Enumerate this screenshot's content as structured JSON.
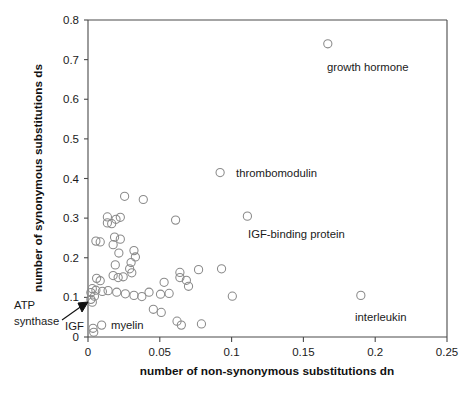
{
  "chart_data": {
    "type": "scatter",
    "title": "",
    "xlabel": "number of non-synonymous substitutions dn",
    "ylabel": "number of synonymous substitutions ds",
    "xlim": [
      0,
      0.25
    ],
    "ylim": [
      0,
      0.8
    ],
    "xticks": [
      "0",
      "0.05",
      "0.1",
      "0.15",
      "0.2",
      "0.25"
    ],
    "xtick_values": [
      0,
      0.05,
      0.1,
      0.15,
      0.2,
      0.25
    ],
    "yticks": [
      "0",
      "0.1",
      "0.2",
      "0.3",
      "0.4",
      "0.5",
      "0.6",
      "0.7",
      "0.8"
    ],
    "ytick_values": [
      0,
      0.1,
      0.2,
      0.3,
      0.4,
      0.5,
      0.6,
      0.7,
      0.8
    ],
    "grid": false,
    "legend": "none",
    "marker": "open-circle",
    "marker_color": "#8a8a8a",
    "points": [
      {
        "x": 0.167,
        "y": 0.74,
        "label": "growth hormone"
      },
      {
        "x": 0.092,
        "y": 0.415,
        "label": "thrombomodulin"
      },
      {
        "x": 0.111,
        "y": 0.305,
        "label": "IGF-binding protein"
      },
      {
        "x": 0.19,
        "y": 0.105,
        "label": "interleukin"
      },
      {
        "x": 0.0045,
        "y": 0.103,
        "label": "ATP synthase"
      },
      {
        "x": 0.0035,
        "y": 0.022,
        "label": "IGF"
      },
      {
        "x": 0.0095,
        "y": 0.03,
        "label": "myelin"
      },
      {
        "x": 0.0255,
        "y": 0.355,
        "label": ""
      },
      {
        "x": 0.0385,
        "y": 0.347,
        "label": ""
      },
      {
        "x": 0.0135,
        "y": 0.303,
        "label": ""
      },
      {
        "x": 0.0135,
        "y": 0.288,
        "label": ""
      },
      {
        "x": 0.0195,
        "y": 0.297,
        "label": ""
      },
      {
        "x": 0.0165,
        "y": 0.286,
        "label": ""
      },
      {
        "x": 0.0225,
        "y": 0.302,
        "label": ""
      },
      {
        "x": 0.061,
        "y": 0.295,
        "label": ""
      },
      {
        "x": 0.0185,
        "y": 0.252,
        "label": ""
      },
      {
        "x": 0.0225,
        "y": 0.247,
        "label": ""
      },
      {
        "x": 0.0055,
        "y": 0.242,
        "label": ""
      },
      {
        "x": 0.0085,
        "y": 0.24,
        "label": ""
      },
      {
        "x": 0.0175,
        "y": 0.233,
        "label": ""
      },
      {
        "x": 0.0215,
        "y": 0.212,
        "label": ""
      },
      {
        "x": 0.032,
        "y": 0.218,
        "label": ""
      },
      {
        "x": 0.033,
        "y": 0.202,
        "label": ""
      },
      {
        "x": 0.03,
        "y": 0.188,
        "label": ""
      },
      {
        "x": 0.019,
        "y": 0.182,
        "label": ""
      },
      {
        "x": 0.029,
        "y": 0.172,
        "label": ""
      },
      {
        "x": 0.0305,
        "y": 0.162,
        "label": ""
      },
      {
        "x": 0.0175,
        "y": 0.155,
        "label": ""
      },
      {
        "x": 0.021,
        "y": 0.15,
        "label": ""
      },
      {
        "x": 0.0245,
        "y": 0.152,
        "label": ""
      },
      {
        "x": 0.006,
        "y": 0.148,
        "label": ""
      },
      {
        "x": 0.0085,
        "y": 0.142,
        "label": ""
      },
      {
        "x": 0.077,
        "y": 0.17,
        "label": ""
      },
      {
        "x": 0.093,
        "y": 0.172,
        "label": ""
      },
      {
        "x": 0.064,
        "y": 0.163,
        "label": ""
      },
      {
        "x": 0.064,
        "y": 0.15,
        "label": ""
      },
      {
        "x": 0.0685,
        "y": 0.143,
        "label": ""
      },
      {
        "x": 0.053,
        "y": 0.138,
        "label": ""
      },
      {
        "x": 0.07,
        "y": 0.128,
        "label": ""
      },
      {
        "x": 0.003,
        "y": 0.122,
        "label": ""
      },
      {
        "x": 0.0055,
        "y": 0.118,
        "label": ""
      },
      {
        "x": 0.002,
        "y": 0.112,
        "label": ""
      },
      {
        "x": 0.01,
        "y": 0.115,
        "label": ""
      },
      {
        "x": 0.014,
        "y": 0.117,
        "label": ""
      },
      {
        "x": 0.02,
        "y": 0.113,
        "label": ""
      },
      {
        "x": 0.026,
        "y": 0.109,
        "label": ""
      },
      {
        "x": 0.032,
        "y": 0.105,
        "label": ""
      },
      {
        "x": 0.0375,
        "y": 0.102,
        "label": ""
      },
      {
        "x": 0.0425,
        "y": 0.113,
        "label": ""
      },
      {
        "x": 0.0505,
        "y": 0.108,
        "label": ""
      },
      {
        "x": 0.0565,
        "y": 0.11,
        "label": ""
      },
      {
        "x": 0.1005,
        "y": 0.103,
        "label": ""
      },
      {
        "x": 0.002,
        "y": 0.095,
        "label": ""
      },
      {
        "x": 0.003,
        "y": 0.088,
        "label": ""
      },
      {
        "x": 0.0455,
        "y": 0.07,
        "label": ""
      },
      {
        "x": 0.051,
        "y": 0.062,
        "label": ""
      },
      {
        "x": 0.062,
        "y": 0.04,
        "label": ""
      },
      {
        "x": 0.065,
        "y": 0.03,
        "label": ""
      },
      {
        "x": 0.079,
        "y": 0.033,
        "label": ""
      },
      {
        "x": 0.004,
        "y": 0.012,
        "label": ""
      }
    ],
    "annotations": [
      {
        "name": "growth-hormone",
        "text": "growth hormone",
        "x": 0.167,
        "y": 0.74
      },
      {
        "name": "thrombomodulin",
        "text": "thrombomodulin",
        "x": 0.092,
        "y": 0.415
      },
      {
        "name": "igf-binding-protein",
        "text": "IGF-binding protein",
        "x": 0.111,
        "y": 0.305
      },
      {
        "name": "interleukin",
        "text": "interleukin",
        "x": 0.19,
        "y": 0.105
      },
      {
        "name": "atp-synthase",
        "text": "ATP",
        "text2": "synthase",
        "x": 0.0045,
        "y": 0.103
      },
      {
        "name": "igf",
        "text": "IGF",
        "x": 0.0035,
        "y": 0.022
      },
      {
        "name": "myelin",
        "text": "myelin",
        "x": 0.0095,
        "y": 0.03
      }
    ]
  },
  "labels": {
    "growth_hormone": "growth hormone",
    "thrombomodulin": "thrombomodulin",
    "igf_binding_protein": "IGF-binding protein",
    "interleukin": "interleukin",
    "atp_synthase_line1": "ATP",
    "atp_synthase_line2": "synthase",
    "igf": "IGF",
    "myelin": "myelin",
    "xaxis_title": "number of non-synonymous substitutions dn",
    "yaxis_title": "number of synonymous substitutions ds"
  }
}
